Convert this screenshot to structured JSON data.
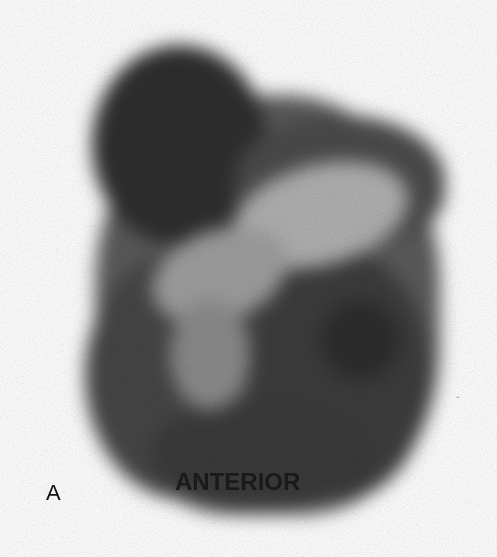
{
  "figure": {
    "panel_label": "A",
    "view_label": "ANTERIOR",
    "edge_mark": "ˬ",
    "colors": {
      "background": "#ffffff",
      "dark_uptake": "#2b2b2b",
      "mid_uptake": "#5a5a5a",
      "light_region": "#a8a8a8"
    }
  }
}
